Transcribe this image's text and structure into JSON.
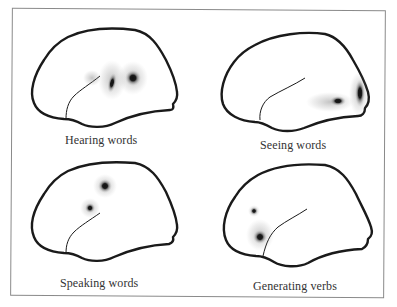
{
  "figure": {
    "corner_fragment": "...g",
    "panels": [
      {
        "id": "hearing",
        "label": "Hearing words",
        "hemisphere_orientation": "left-lateral",
        "activations": [
          "temporal-posterior-small",
          "temporal-elongated",
          "temporal-parietal-dark"
        ]
      },
      {
        "id": "seeing",
        "label": "Seeing words",
        "hemisphere_orientation": "left-lateral",
        "activations": [
          "occipital-elongated",
          "occipitotemporal-oval"
        ]
      },
      {
        "id": "speaking",
        "label": "Speaking words",
        "hemisphere_orientation": "left-lateral",
        "activations": [
          "motor-cortex-upper",
          "motor-cortex-lower"
        ]
      },
      {
        "id": "generating",
        "label": "Generating verbs",
        "hemisphere_orientation": "mirrored",
        "activations": [
          "frontal-small",
          "frontal-inferior-large"
        ]
      }
    ]
  },
  "colors": {
    "outline": "#1a1a1a",
    "stipple": "#222222",
    "frame": "#8a8a8a",
    "label": "#333333"
  }
}
